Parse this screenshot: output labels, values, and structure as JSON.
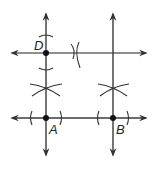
{
  "diagram": {
    "labels": {
      "D": "D",
      "A": "A",
      "B": "B"
    },
    "colors": {
      "line": "#4d4d4d",
      "point": "#111111",
      "arc": "#333333",
      "background": "#ffffff"
    },
    "points": [
      {
        "name": "D",
        "x": 46,
        "y": 53
      },
      {
        "name": "A",
        "x": 46,
        "y": 118
      },
      {
        "name": "B",
        "x": 113,
        "y": 118
      }
    ]
  }
}
